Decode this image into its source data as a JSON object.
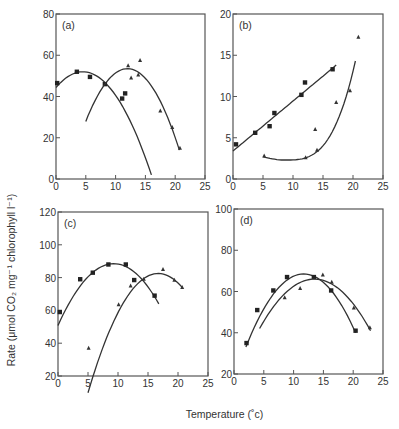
{
  "figure": {
    "ylabel": "Rate (μmol CO₂ mg⁻¹ chlorophyll l⁻¹)",
    "xlabel": "Temperature (˚c)"
  },
  "chart_data": [
    {
      "type": "scatter",
      "panel": "(a)",
      "title": "(a)",
      "xlabel": "Temperature (˚c)",
      "ylabel": "Rate (μmol CO₂ mg⁻¹ chlorophyll l⁻¹)",
      "xlim": [
        0,
        25
      ],
      "ylim": [
        0,
        80
      ],
      "xticks": [
        0,
        5,
        10,
        15,
        20,
        25
      ],
      "yticks": [
        0,
        20,
        40,
        60,
        80
      ],
      "box": {
        "left": 56,
        "top": 14,
        "right": 205,
        "bottom": 179
      },
      "series": [
        {
          "name": "squares",
          "marker": "square",
          "x": [
            0.2,
            3.5,
            5.7,
            8.2,
            11.1,
            11.6
          ],
          "y": [
            46.5,
            52,
            49.5,
            46,
            39,
            41.5
          ],
          "fit": {
            "type": "quadratic",
            "x0": 4.5,
            "ypeak": 52,
            "xstart": 0,
            "xend": 16,
            "yend": 2
          }
        },
        {
          "name": "triangles",
          "marker": "triangle",
          "x": [
            12.1,
            12.6,
            13.8,
            14.1,
            17.5,
            19.5,
            20.8
          ],
          "y": [
            55,
            49,
            50.5,
            57.5,
            33,
            25,
            15
          ],
          "fit": {
            "type": "quadratic",
            "x0": 12,
            "ypeak": 53.5,
            "xstart": 5,
            "xend": 20.7,
            "yend": 14
          }
        }
      ]
    },
    {
      "type": "scatter",
      "panel": "(b)",
      "title": "(b)",
      "xlabel": "Temperature (˚c)",
      "ylabel": "Rate (μmol CO₂ mg⁻¹ chlorophyll l⁻¹)",
      "xlim": [
        0,
        25
      ],
      "ylim": [
        0,
        20
      ],
      "xticks": [
        0,
        5,
        10,
        15,
        20,
        25
      ],
      "yticks": [
        0,
        5,
        10,
        15,
        20
      ],
      "box": {
        "left": 233,
        "top": 14,
        "right": 383,
        "bottom": 179
      },
      "series": [
        {
          "name": "squares",
          "marker": "square",
          "x": [
            0.5,
            3.7,
            6.1,
            6.9,
            11.4,
            12.0,
            16.6
          ],
          "y": [
            4.2,
            5.6,
            6.4,
            8.0,
            10.2,
            11.7,
            13.3
          ],
          "fit": {
            "type": "linear",
            "xstart": 0,
            "ystart": 3.4,
            "xend": 17.2,
            "yend": 13.8
          }
        },
        {
          "name": "triangles",
          "marker": "triangle",
          "x": [
            5.2,
            12.1,
            13.7,
            14.0,
            17.2,
            19.5,
            20.9
          ],
          "y": [
            2.8,
            2.6,
            6.0,
            3.5,
            9.3,
            10.7,
            17.2
          ],
          "fit": {
            "type": "exp",
            "xstart": 5,
            "xend": 20.4,
            "ystart": 2.7,
            "ymin": 2.3,
            "xmin": 8.5,
            "yend": 14.3
          }
        }
      ]
    },
    {
      "type": "scatter",
      "panel": "(c)",
      "title": "(c)",
      "xlabel": "Temperature (˚c)",
      "ylabel": "Rate (μmol CO₂ mg⁻¹ chlorophyll l⁻¹)",
      "xlim": [
        0,
        25
      ],
      "ylim": [
        20,
        120
      ],
      "xticks": [
        0,
        5,
        10,
        15,
        20,
        25
      ],
      "yticks": [
        20,
        40,
        60,
        80,
        100,
        120
      ],
      "box": {
        "left": 58,
        "top": 212,
        "right": 208,
        "bottom": 376
      },
      "series": [
        {
          "name": "squares",
          "marker": "square",
          "x": [
            0.3,
            3.7,
            5.8,
            8.4,
            11.3,
            12.7,
            16.1
          ],
          "y": [
            59,
            79,
            83,
            88,
            88,
            78.5,
            69
          ],
          "fit": {
            "type": "quadratic",
            "x0": 9.3,
            "ypeak": 88.5,
            "xstart": 0,
            "xend": 16.8,
            "yend": 64
          }
        },
        {
          "name": "triangles",
          "marker": "triangle",
          "x": [
            5.1,
            10.1,
            12.1,
            14.3,
            17.5,
            19.4,
            20.7
          ],
          "y": [
            37,
            63.5,
            75,
            79,
            85,
            78.5,
            74
          ],
          "fit": {
            "type": "quadratic",
            "x0": 16.7,
            "ypeak": 82.5,
            "xstart": 5,
            "xend": 20.7,
            "yend": 74
          }
        }
      ]
    },
    {
      "type": "scatter",
      "panel": "(d)",
      "title": "(d)",
      "xlabel": "Temperature (˚c)",
      "ylabel": "Rate (μmol CO₂ mg⁻¹ chlorophyll l⁻¹)",
      "xlim": [
        0,
        25
      ],
      "ylim": [
        20,
        100
      ],
      "xticks": [
        0,
        5,
        10,
        15,
        20,
        25
      ],
      "yticks": [
        20,
        40,
        60,
        80,
        100
      ],
      "box": {
        "left": 234,
        "top": 209,
        "right": 383,
        "bottom": 374
      },
      "series": [
        {
          "name": "squares",
          "marker": "square",
          "x": [
            2.1,
            3.9,
            6.6,
            8.9,
            13.4,
            16.3,
            20.4
          ],
          "y": [
            35,
            51,
            60.5,
            67,
            67,
            60.5,
            41
          ],
          "fit": {
            "type": "quadratic",
            "x0": 11.7,
            "ypeak": 68.5,
            "xstart": 2,
            "xend": 20.4,
            "yend": 40
          }
        },
        {
          "name": "triangles",
          "marker": "triangle",
          "x": [
            8.5,
            11.1,
            14.9,
            16.4,
            20.1,
            22.8
          ],
          "y": [
            57,
            61.5,
            68,
            64.5,
            52,
            42.5
          ],
          "fit": {
            "type": "quadratic",
            "x0": 13.5,
            "ypeak": 66,
            "xstart": 4.3,
            "xend": 22.9,
            "yend": 41
          }
        }
      ]
    }
  ]
}
